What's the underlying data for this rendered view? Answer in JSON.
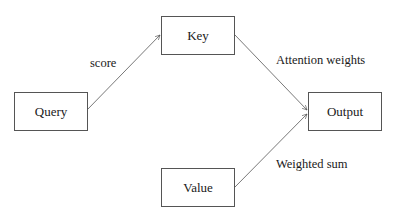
{
  "diagram": {
    "nodes": [
      {
        "id": "query",
        "label": "Query"
      },
      {
        "id": "key",
        "label": "Key"
      },
      {
        "id": "value",
        "label": "Value"
      },
      {
        "id": "output",
        "label": "Output"
      }
    ],
    "edges": [
      {
        "from": "query",
        "to": "key",
        "label": "score"
      },
      {
        "from": "key",
        "to": "output",
        "label": "Attention weights"
      },
      {
        "from": "value",
        "to": "output",
        "label": "Weighted sum"
      }
    ],
    "colors": {
      "stroke": "#555555",
      "text": "#1a1a1a",
      "background": "#ffffff"
    }
  }
}
